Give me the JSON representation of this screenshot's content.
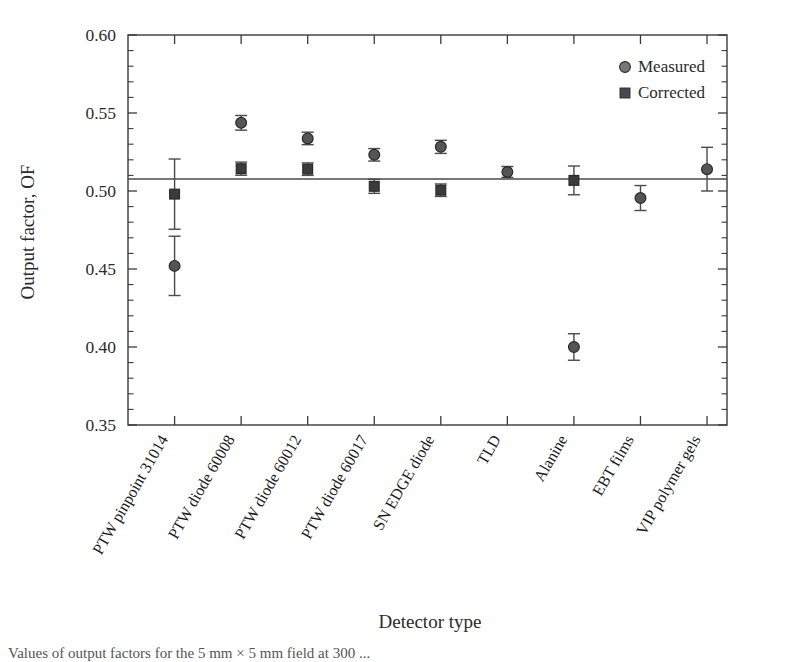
{
  "chart_data": {
    "type": "scatter",
    "title": "",
    "xlabel": "Detector type",
    "ylabel": "Output factor, OF",
    "ylim": [
      0.35,
      0.6
    ],
    "ytick_major_step": 0.05,
    "ytick_minor_step": 0.01,
    "ytick_labels": [
      "0.60",
      "0.55",
      "0.50",
      "0.45",
      "0.40",
      "0.35"
    ],
    "ytick_values": [
      0.6,
      0.55,
      0.5,
      0.45,
      0.4,
      0.35
    ],
    "grid": false,
    "legend_position": "top-right",
    "reference_line": 0.5077,
    "categories": [
      "PTW pinpoint 31014",
      "PTW diode 60008",
      "PTW diode 60012",
      "PTW diode 60017",
      "SN EDGE diode",
      "TLD",
      "Alanine",
      "EBT films",
      "VIP polymer gels"
    ],
    "series": [
      {
        "name": "Measured",
        "marker": "circle",
        "color": "#555555",
        "values": [
          0.452,
          0.5437,
          0.5337,
          0.5232,
          0.5283,
          0.5122,
          0.4,
          0.4955,
          0.514
        ],
        "errors": [
          0.019,
          0.0047,
          0.004,
          0.004,
          0.0042,
          0.0035,
          0.0085,
          0.008,
          0.014
        ]
      },
      {
        "name": "Corrected",
        "marker": "square",
        "color": "#3b3b3b",
        "values": [
          0.498,
          0.5143,
          0.514,
          0.503,
          0.5005,
          null,
          0.5068,
          null,
          null
        ],
        "errors": [
          0.0225,
          0.0042,
          0.004,
          0.0045,
          0.004,
          null,
          0.0092,
          null,
          null
        ]
      }
    ]
  },
  "legend": {
    "entries": [
      {
        "label": "Measured",
        "marker": "circle"
      },
      {
        "label": "Corrected",
        "marker": "square"
      }
    ]
  },
  "caption": {
    "text": "Values of output factors for the 5 mm × 5 mm field at 300 ..."
  }
}
